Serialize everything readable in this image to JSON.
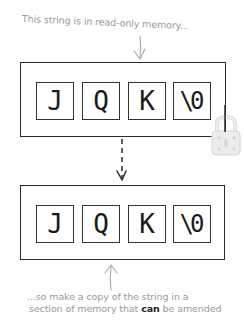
{
  "annotations": {
    "top": "This string is in read-only memory...",
    "bottom_line1": "...so make a copy of the string in a",
    "bottom_line2_before": "section of memory that ",
    "bottom_line2_emph": "can",
    "bottom_line2_after": " be amended"
  },
  "read_only_array": {
    "label": "read-only memory block",
    "cells": [
      "J",
      "Q",
      "K",
      "\\0"
    ],
    "locked": true
  },
  "writable_array": {
    "label": "amendable memory block",
    "cells": [
      "J",
      "Q",
      "K",
      "\\0"
    ],
    "locked": false
  },
  "icons": {
    "lock": "padlock-icon",
    "copy_arrow": "dashed-down-arrow",
    "pointer_top": "down-arrow",
    "pointer_bottom": "up-arrow"
  },
  "colors": {
    "annotation_text": "#9a9a9a",
    "box_border": "#2a2a2a",
    "lock": "#e2e2e2"
  }
}
